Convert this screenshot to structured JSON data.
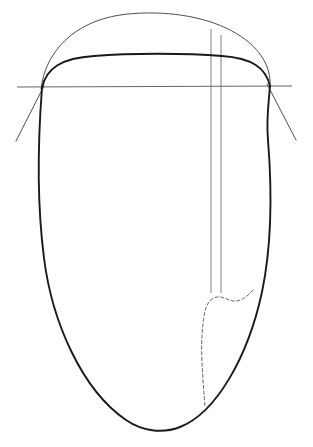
{
  "figure": {
    "title": "Ovoid cross-section construction drawing",
    "canvas": {
      "width": 313,
      "height": 447,
      "background": "#ffffff"
    },
    "colors": {
      "outline": "#1a1a1a",
      "thin_line": "#3a3a3a",
      "rule_line": "#4a4a4a",
      "vertical_guide": "#6a6a6a",
      "dashed_contour": "#5a5a5a"
    },
    "elements": [
      {
        "id": "ovoid-outline",
        "name": "ovoid-outline",
        "label": "Main ovoid outline",
        "style": "solid-heavy",
        "path": "M 42 88 C 38 140 36 196 44 258 C 52 322 82 390 126 420 C 142 431 162 434 180 427 C 216 413 248 357 262 292 C 272 244 272 190 268 140 C 266 118 269 100 270 86"
      },
      {
        "id": "inner-crown-arc",
        "name": "inner-crown-arc",
        "label": "Inner crown arc (heavy)",
        "style": "solid-heavy",
        "path": "M 42 88 C 46 68 62 58 94 56 C 130 53 186 53 222 56 C 252 58 266 68 270 86"
      },
      {
        "id": "outer-crown-arc",
        "name": "outer-crown-arc",
        "label": "Outer crown arc (thin)",
        "style": "solid-thin",
        "path": "M 41 89 C 45 52 74 22 120 15 C 156 10 196 14 226 28 C 256 42 272 64 270 87"
      },
      {
        "id": "horizontal-reference-line",
        "name": "horizontal-reference-line",
        "label": "Horizontal base reference line",
        "style": "rule",
        "x1": 17,
        "y1": 87,
        "x2": 292,
        "y2": 86
      },
      {
        "id": "vertical-guide-left",
        "name": "vertical-guide-left",
        "label": "Left vertical guide line",
        "style": "vertical",
        "x1": 211,
        "y1": 29,
        "x2": 211,
        "y2": 293
      },
      {
        "id": "vertical-guide-right",
        "name": "vertical-guide-right",
        "label": "Right vertical guide line",
        "style": "vertical",
        "x1": 221,
        "y1": 35,
        "x2": 221,
        "y2": 293
      },
      {
        "id": "diagonal-tangent-left",
        "name": "diagonal-tangent-left",
        "label": "Left diagonal tangent line",
        "style": "solid-thin",
        "x1": 44,
        "y1": 86,
        "x2": 16,
        "y2": 141
      },
      {
        "id": "diagonal-tangent-right",
        "name": "diagonal-tangent-right",
        "label": "Right diagonal tangent line",
        "style": "solid-thin",
        "x1": 267,
        "y1": 84,
        "x2": 296,
        "y2": 140
      },
      {
        "id": "dashed-crown-contour",
        "name": "dashed-crown-contour",
        "label": "Dashed contour beneath crown",
        "style": "dashed",
        "path": "M 205 62 C 206 72 209 80 214 83 C 219 86 226 84 231 79 C 236 74 240 68 242 62"
      },
      {
        "id": "dashed-interior-contour",
        "name": "dashed-interior-contour",
        "label": "Dashed interior contour (air cell / chamber)",
        "style": "dashed",
        "path": "M 253 290 C 247 297 240 302 233 301 C 227 300 223 296 217 297 C 211 298 207 303 205 311 C 202 326 201 344 202 362 C 203 380 204 396 205 406"
      }
    ]
  }
}
